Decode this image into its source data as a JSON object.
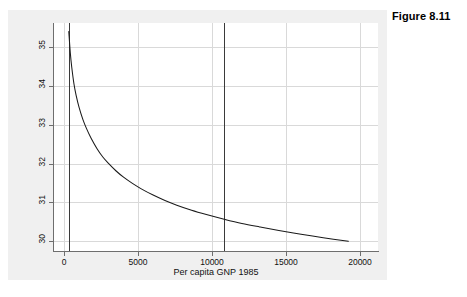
{
  "figure": {
    "caption": "Figure 8.11"
  },
  "chart_data": {
    "type": "line",
    "title": "",
    "subtitle": "",
    "xlabel": "Per capita GNP 1985",
    "ylabel": "birth = f(gnpcap | srmort = 2.49)",
    "xlim": [
      -700,
      21200
    ],
    "ylim": [
      29.75,
      35.62
    ],
    "xticks": [
      0,
      5000,
      10000,
      15000,
      20000
    ],
    "xticklabels": [
      "0",
      "5000",
      "10000",
      "15000",
      "20000"
    ],
    "yticks": [
      30,
      31,
      32,
      33,
      34,
      35
    ],
    "yticklabels": [
      "30",
      "31",
      "32",
      "33",
      "34",
      "35"
    ],
    "grid": true,
    "grid_color": "#d9d9d9",
    "legend": null,
    "line_color": "#1a1a1a",
    "background_color": "#f0f0f0",
    "plot_background_color": "#ffffff",
    "series": [
      {
        "name": "birth = f(gnpcap | srmort = 2.49)",
        "x": [
          300,
          400,
          500,
          650,
          800,
          1000,
          1250,
          1500,
          1800,
          2200,
          2600,
          3000,
          3500,
          4000,
          4600,
          5200,
          6000,
          6800,
          7600,
          8600,
          9600,
          10800,
          12000,
          13200,
          14500,
          16000,
          17500,
          19200
        ],
        "y": [
          35.4,
          34.86,
          34.48,
          34.05,
          33.75,
          33.44,
          33.14,
          32.9,
          32.66,
          32.39,
          32.17,
          32.0,
          31.81,
          31.65,
          31.49,
          31.35,
          31.19,
          31.05,
          30.93,
          30.8,
          30.69,
          30.57,
          30.46,
          30.37,
          30.28,
          30.18,
          30.09,
          30.0
        ]
      }
    ],
    "reference_lines": [
      {
        "name": "min-gnpcap-reference",
        "orientation": "vertical",
        "x": 300,
        "color": "#3a3a3a"
      },
      {
        "name": "mean-gnpcap-reference",
        "orientation": "vertical",
        "x": 10800,
        "color": "#3a3a3a"
      }
    ]
  }
}
